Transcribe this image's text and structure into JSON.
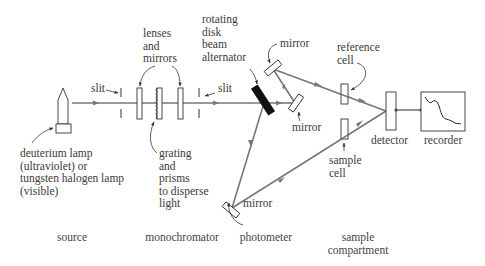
{
  "diagram": {
    "type": "double-beam UV-Vis spectrophotometer schematic",
    "colors": {
      "beam": "#777777",
      "outline": "#333333",
      "chopper": "#111111",
      "text": "#3a3a3a"
    }
  },
  "labels": {
    "lenses_and_mirrors": "lenses\nand\nmirrors",
    "rotating_disk": "rotating\ndisk\nbeam\nalternator",
    "slit_left": "slit",
    "slit_right": "slit",
    "mirror_top": "mirror",
    "mirror_right": "mirror",
    "mirror_bottom": "mirror",
    "reference_cell": "reference\ncell",
    "sample_cell": "sample\ncell",
    "detector": "detector",
    "recorder": "recorder",
    "lamp": "deuterium lamp\n(ultraviolet) or\ntungsten halogen lamp\n(visible)",
    "grating": "grating\nand\nprisms\nto disperse\nlight"
  },
  "sections": [
    {
      "id": "source",
      "label": "source"
    },
    {
      "id": "monochromator",
      "label": "monochromator"
    },
    {
      "id": "photometer",
      "label": "photometer"
    },
    {
      "id": "sample-compartment",
      "label": "sample\ncompartment"
    }
  ]
}
